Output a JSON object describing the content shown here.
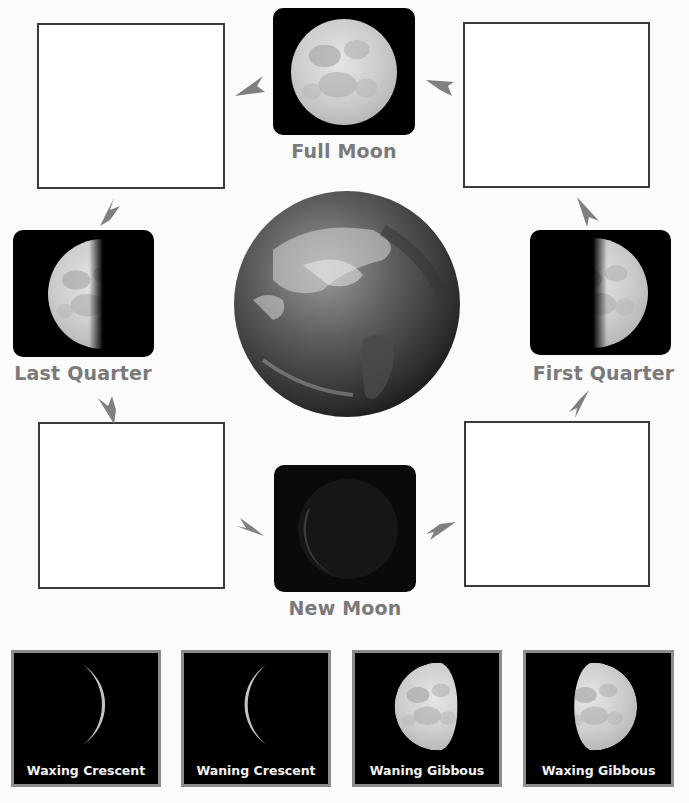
{
  "diagram": {
    "center": {
      "name": "Earth",
      "icon": "earth-globe-icon"
    },
    "phases": {
      "full_moon": {
        "label": "Full Moon"
      },
      "last_quarter": {
        "label": "Last Quarter"
      },
      "first_quarter": {
        "label": "First Quarter"
      },
      "new_moon": {
        "label": "New Moon"
      }
    },
    "blank_boxes": [
      {
        "position": "top-left",
        "content": ""
      },
      {
        "position": "top-right",
        "content": ""
      },
      {
        "position": "bottom-left",
        "content": ""
      },
      {
        "position": "bottom-right",
        "content": ""
      }
    ],
    "cycle_order": [
      "New Moon",
      "blank (bottom-right)",
      "First Quarter",
      "blank (top-right)",
      "Full Moon",
      "blank (top-left)",
      "Last Quarter",
      "blank (bottom-left)"
    ],
    "arrow_color": "#808080",
    "label_color": "#7a7a7a"
  },
  "answer_choices": [
    {
      "label": "Waxing Crescent"
    },
    {
      "label": "Waning Crescent"
    },
    {
      "label": "Waning Gibbous"
    },
    {
      "label": "Waxing Gibbous"
    }
  ]
}
